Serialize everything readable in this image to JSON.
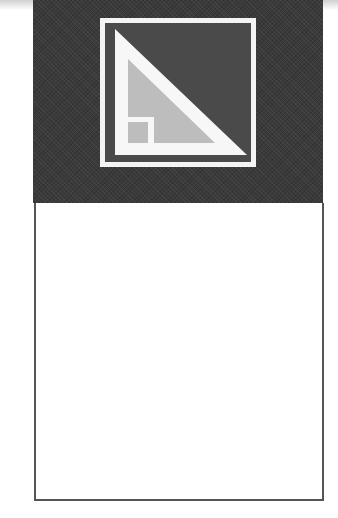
{
  "logo": {
    "icon": "set-square-triangle-logo-icon",
    "colors": {
      "panel_background": "#3a3a3a",
      "frame": "#f4f4f4",
      "inner_square": "#4a4a4a",
      "triangle": "#f7f7f7",
      "inner_triangle": "#bdbdbd"
    }
  },
  "content_box": {
    "text": ""
  }
}
